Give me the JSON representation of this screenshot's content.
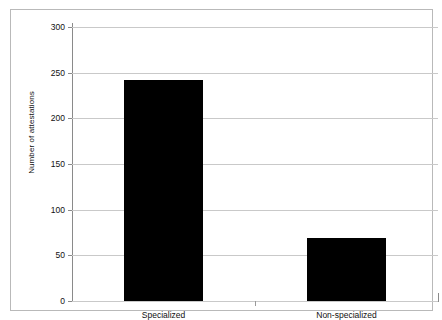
{
  "chart_data": {
    "type": "bar",
    "title": "",
    "xlabel": "",
    "ylabel": "Number of attestations",
    "categories": [
      "Specialized",
      "Non-specialized"
    ],
    "values": [
      242,
      69
    ],
    "ylim": [
      0,
      300
    ],
    "yticks": [
      0,
      50,
      100,
      150,
      200,
      250,
      300
    ],
    "ytick_labels": [
      "0",
      "50",
      "100",
      "150",
      "200",
      "250",
      "300"
    ],
    "grid": true,
    "legend": "none",
    "bar_color": "#000000",
    "grid_color": "#c9c9c9",
    "axis_color": "#8a8a8a",
    "frame_color": "#b9b9b9",
    "background": "#ffffff"
  }
}
